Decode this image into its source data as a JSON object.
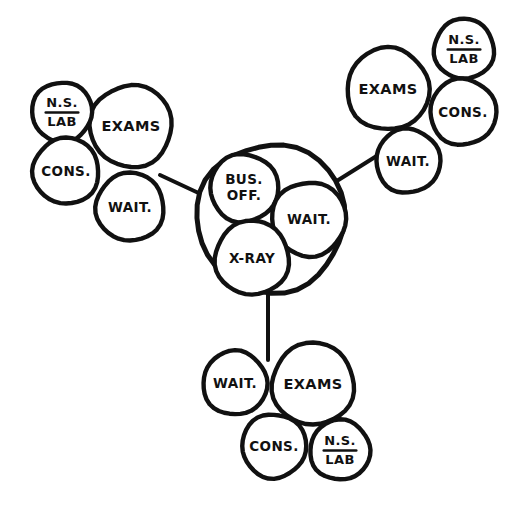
{
  "diagram": {
    "style": {
      "ink_color": "#111111",
      "paper_color": "#ffffff",
      "stroke_width_large": 5.0,
      "stroke_width_small": 4.4,
      "stroke_width_connector": 4.0
    },
    "labels": {
      "exams": "EXAMS",
      "wait": "WAIT.",
      "cons": "CONS.",
      "ns": "N.S.",
      "lab": "LAB",
      "bus_off_line1": "BUS.",
      "bus_off_line2": "OFF.",
      "xray": "X-RAY"
    },
    "hub": {
      "name": "core-services-hub",
      "outer": {
        "cx": 271,
        "cy": 218,
        "r": 74
      },
      "nodes": [
        {
          "id": "hub-bus-off",
          "label_key": "bus_off",
          "cx": 244,
          "cy": 188,
          "r": 34,
          "font": 13.5,
          "two_line": true
        },
        {
          "id": "hub-wait",
          "label_key": "wait",
          "cx": 309,
          "cy": 219,
          "r": 37,
          "font": 13.5,
          "two_line": false
        },
        {
          "id": "hub-xray",
          "label_key": "xray",
          "cx": 252,
          "cy": 258,
          "r": 37,
          "font": 13.5,
          "two_line": false
        }
      ]
    },
    "clusters": [
      {
        "id": "cluster-left",
        "name": "west-exam-cluster",
        "nodes": [
          {
            "id": "left-exams",
            "label_key": "exams",
            "cx": 131,
            "cy": 126,
            "r": 41,
            "font": 14.5
          },
          {
            "id": "left-nslab",
            "label_key": "nslab",
            "cx": 62,
            "cy": 112,
            "r": 30,
            "font": 13.0
          },
          {
            "id": "left-cons",
            "label_key": "cons",
            "cx": 66,
            "cy": 171,
            "r": 33,
            "font": 13.5
          },
          {
            "id": "left-wait",
            "label_key": "wait",
            "cx": 130,
            "cy": 207,
            "r": 34,
            "font": 13.5
          }
        ]
      },
      {
        "id": "cluster-topright",
        "name": "northeast-exam-cluster",
        "nodes": [
          {
            "id": "tr-exams",
            "label_key": "exams",
            "cx": 388,
            "cy": 89,
            "r": 41,
            "font": 14.5
          },
          {
            "id": "tr-nslab",
            "label_key": "nslab",
            "cx": 464,
            "cy": 49,
            "r": 30,
            "font": 13.0
          },
          {
            "id": "tr-cons",
            "label_key": "cons",
            "cx": 463,
            "cy": 112,
            "r": 33,
            "font": 13.5
          },
          {
            "id": "tr-wait",
            "label_key": "wait",
            "cx": 408,
            "cy": 161,
            "r": 32,
            "font": 13.5
          }
        ]
      },
      {
        "id": "cluster-bottom",
        "name": "south-exam-cluster",
        "nodes": [
          {
            "id": "bot-exams",
            "label_key": "exams",
            "cx": 313,
            "cy": 384,
            "r": 41,
            "font": 14.5
          },
          {
            "id": "bot-wait",
            "label_key": "wait",
            "cx": 235,
            "cy": 383,
            "r": 32,
            "font": 13.5
          },
          {
            "id": "bot-cons",
            "label_key": "cons",
            "cx": 274,
            "cy": 446,
            "r": 32,
            "font": 13.5
          },
          {
            "id": "bot-nslab",
            "label_key": "nslab",
            "cx": 340,
            "cy": 450,
            "r": 30,
            "font": 13.0
          }
        ]
      }
    ],
    "connectors": [
      {
        "id": "connector-left-to-hub",
        "name": "link-west-cluster",
        "x1": 160,
        "y1": 175,
        "x2": 205,
        "y2": 196
      },
      {
        "id": "connector-topright-to-hub",
        "name": "link-northeast-cluster",
        "x1": 332,
        "y1": 184,
        "x2": 383,
        "y2": 152
      },
      {
        "id": "connector-bottom-to-hub",
        "name": "link-south-cluster",
        "x1": 268,
        "y1": 291,
        "x2": 268,
        "y2": 360
      }
    ]
  }
}
